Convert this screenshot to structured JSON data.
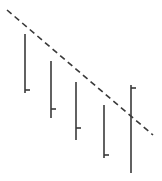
{
  "diagram": {
    "width": 162,
    "height": 181,
    "background": "#ffffff",
    "stroke_color": "#3a3a3a",
    "dashed_line": {
      "x1": 7,
      "y1": 10,
      "x2": 153,
      "y2": 135,
      "dash": "6,4",
      "stroke_width": 1.6
    },
    "vertical_lines": [
      {
        "x": 25,
        "y_top": 34,
        "y_bottom": 93,
        "tick_y": 90,
        "tick_len": 5,
        "stroke_width": 1.6
      },
      {
        "x": 51,
        "y_top": 61,
        "y_bottom": 118,
        "tick_y": 109,
        "tick_len": 5,
        "stroke_width": 1.6
      },
      {
        "x": 76,
        "y_top": 82,
        "y_bottom": 140,
        "tick_y": 128,
        "tick_len": 5,
        "stroke_width": 1.6
      },
      {
        "x": 104,
        "y_top": 105,
        "y_bottom": 158,
        "tick_y": 155,
        "tick_len": 5,
        "stroke_width": 1.6
      },
      {
        "x": 131,
        "y_top": 85,
        "y_bottom": 173,
        "tick_y": 88,
        "tick_len": 5,
        "stroke_width": 1.6
      }
    ]
  }
}
